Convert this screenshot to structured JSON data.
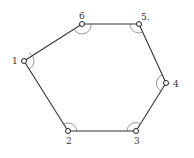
{
  "diagram": {
    "type": "hexagon-traverse",
    "stroke_color": "#333333",
    "vertices": [
      {
        "id": "1",
        "label": "1",
        "x": 24,
        "y": 61,
        "label_x": 12,
        "label_y": 64
      },
      {
        "id": "2",
        "label": "2",
        "x": 68,
        "y": 131,
        "label_x": 66,
        "label_y": 144
      },
      {
        "id": "3",
        "label": "3",
        "x": 136,
        "y": 131,
        "label_x": 134,
        "label_y": 144
      },
      {
        "id": "4",
        "label": "4",
        "x": 166,
        "y": 83,
        "label_x": 173,
        "label_y": 87
      },
      {
        "id": "5",
        "label": "5.",
        "x": 139,
        "y": 24,
        "label_x": 141,
        "label_y": 20
      },
      {
        "id": "6",
        "label": "6",
        "x": 82,
        "y": 24,
        "label_x": 79,
        "label_y": 19
      }
    ],
    "edges": [
      [
        "1",
        "2"
      ],
      [
        "2",
        "3"
      ],
      [
        "3",
        "4"
      ],
      [
        "4",
        "5"
      ],
      [
        "5",
        "6"
      ],
      [
        "6",
        "1"
      ]
    ]
  }
}
